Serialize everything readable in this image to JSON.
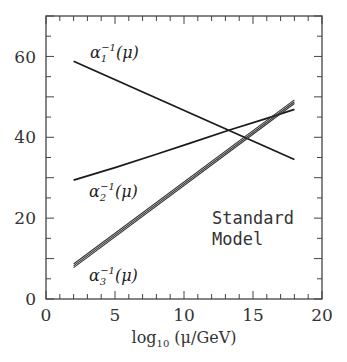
{
  "chart_data": {
    "type": "line",
    "title": "",
    "xlabel": "log10 (μ/GeV)",
    "xlabel_parts": {
      "base": "log",
      "sub": "10",
      "rest": " (μ/GeV)"
    },
    "ylabel": "",
    "xlim": [
      0,
      20
    ],
    "ylim": [
      0,
      70
    ],
    "x_ticks": [
      0,
      5,
      10,
      15,
      20
    ],
    "y_ticks": [
      0,
      20,
      40,
      60
    ],
    "x_tick_labels": [
      "0",
      "5",
      "10",
      "15",
      "20"
    ],
    "y_tick_labels": [
      "0",
      "20",
      "40",
      "60"
    ],
    "grid": false,
    "annotation": [
      "Standard",
      "Model"
    ],
    "series": [
      {
        "name": "α1^-1(μ)",
        "label_base": "α",
        "label_sub": "1",
        "label_sup": "−1",
        "label_rest": "(μ)",
        "x": [
          2,
          18
        ],
        "y": [
          58.8,
          34.5
        ],
        "style": "single"
      },
      {
        "name": "α2^-1(μ)",
        "label_base": "α",
        "label_sub": "2",
        "label_sup": "−1",
        "label_rest": "(μ)",
        "x": [
          2,
          5,
          8,
          10.5,
          13.3,
          16,
          18
        ],
        "y": [
          29.4,
          32.5,
          35.8,
          38.6,
          41.8,
          44.7,
          46.9
        ],
        "style": "single"
      },
      {
        "name": "α3^-1(μ)",
        "label_base": "α",
        "label_sub": "3",
        "label_sup": "−1",
        "label_rest": "(μ)",
        "x": [
          2,
          18
        ],
        "y": [
          8.2,
          48.8
        ],
        "style": "band",
        "band_width": 0.9
      }
    ]
  }
}
